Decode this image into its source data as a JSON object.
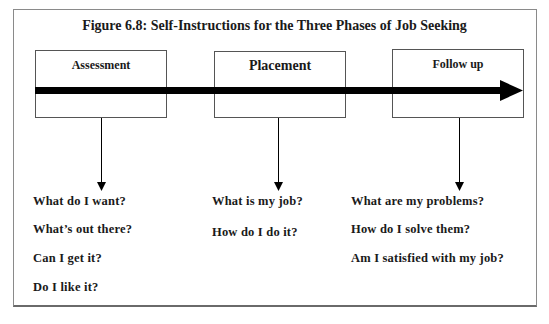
{
  "title": "Figure 6.8: Self-Instructions for the Three Phases of Job Seeking",
  "phases": [
    {
      "label": "Assessment",
      "questions": [
        "What do I want?",
        "What’s out there?",
        "Can I get it?",
        "Do I like it?"
      ]
    },
    {
      "label": "Placement",
      "questions": [
        "What is my job?",
        "How do I do it?"
      ]
    },
    {
      "label": "Follow up",
      "questions": [
        "What are my problems?",
        "How do I solve them?",
        "Am I satisfied with my job?"
      ]
    }
  ],
  "colors": {
    "line": "#000000",
    "border": "#555555"
  }
}
